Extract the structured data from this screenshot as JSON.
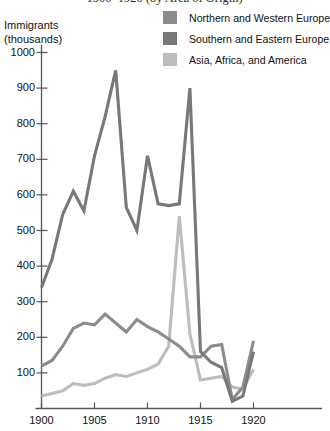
{
  "chart_data": {
    "type": "line",
    "title": "1900–1920 (by Area of Origin)",
    "xlabel": "",
    "ylabel": "Immigrants (thousands)",
    "ylabel_line1": "Immigrants",
    "ylabel_line2": "(thousands)",
    "grid": false,
    "legend_position": "top-right",
    "xlim": [
      1899,
      1921
    ],
    "ylim": [
      0,
      1050
    ],
    "x": [
      1900,
      1901,
      1902,
      1903,
      1904,
      1905,
      1906,
      1907,
      1908,
      1909,
      1910,
      1911,
      1912,
      1913,
      1914,
      1915,
      1916,
      1917,
      1918,
      1919,
      1920
    ],
    "ytick_labels": [
      "1000",
      "900",
      "800",
      "700",
      "600",
      "500",
      "400",
      "300",
      "200",
      "100"
    ],
    "ytick_values": [
      1000,
      900,
      800,
      700,
      600,
      500,
      400,
      300,
      200,
      100
    ],
    "xtick_labels": [
      "1900",
      "1905",
      "1910",
      "1915",
      "1920"
    ],
    "xtick_values": [
      1900,
      1905,
      1910,
      1915,
      1920
    ],
    "series": [
      {
        "name": "Northern and Western Europe",
        "color": "#8c8c8c",
        "values": [
          120,
          135,
          175,
          225,
          240,
          235,
          265,
          240,
          215,
          250,
          230,
          215,
          195,
          175,
          145,
          145,
          175,
          180,
          25,
          60,
          190
        ]
      },
      {
        "name": "Southern and Eastern Europe",
        "color": "#787878",
        "values": [
          340,
          420,
          545,
          610,
          555,
          710,
          820,
          950,
          565,
          500,
          710,
          575,
          570,
          575,
          900,
          160,
          130,
          115,
          20,
          35,
          160
        ]
      },
      {
        "name": "Asia, Africa, and America",
        "color": "#bdbdbd",
        "values": [
          35,
          42,
          50,
          70,
          65,
          70,
          85,
          95,
          90,
          100,
          110,
          125,
          175,
          540,
          210,
          80,
          85,
          90,
          60,
          55,
          110
        ]
      }
    ]
  },
  "legend": {
    "items": [
      {
        "label": "Northern and Western Europe",
        "color": "#8c8c8c",
        "icon": "legend-swatch-icon"
      },
      {
        "label": "Southern and Eastern Europe",
        "color": "#787878",
        "icon": "legend-swatch-icon"
      },
      {
        "label": "Asia, Africa, and America",
        "color": "#bdbdbd",
        "icon": "legend-swatch-icon"
      }
    ]
  },
  "axis": {
    "color": "#555555"
  }
}
